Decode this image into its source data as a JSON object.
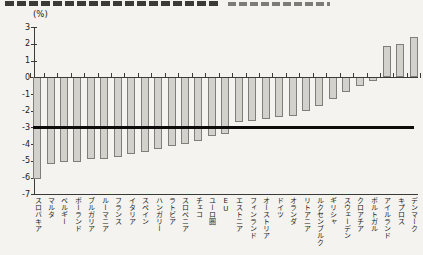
{
  "figure": {
    "cropped_title_visible": true,
    "unit_label": "(%)"
  },
  "chart_data": {
    "type": "bar",
    "title": "",
    "unit_label": "(%)",
    "categories": [
      "スロバキア",
      "マルタ",
      "ベルギー",
      "ポーランド",
      "ブルガリア",
      "ルーマニア",
      "フランス",
      "イタリア",
      "スペイン",
      "ハンガリー",
      "ラトビア",
      "スロベニア",
      "チェコ",
      "ユーロ圏",
      "EU",
      "エストニア",
      "フィンランド",
      "オーストリア",
      "ドイツ",
      "オランダ",
      "リトアニア",
      "ルクセンブルク",
      "ギリシャ",
      "スウェーデン",
      "クロアチア",
      "ポルトガル",
      "アイルランド",
      "キプロス",
      "デンマーク"
    ],
    "values": [
      -6.1,
      -5.2,
      -5.1,
      -5.1,
      -4.9,
      -4.9,
      -4.8,
      -4.6,
      -4.5,
      -4.3,
      -4.1,
      -4.0,
      -3.8,
      -3.5,
      -3.4,
      -2.7,
      -2.6,
      -2.5,
      -2.4,
      -2.3,
      -2.0,
      -1.7,
      -1.3,
      -0.9,
      -0.5,
      -0.2,
      1.9,
      2.0,
      2.4
    ],
    "y_ticks": [
      3,
      2,
      1,
      0,
      -1,
      -2,
      -3,
      -4,
      -5,
      -6,
      -7
    ],
    "ylim": [
      -7,
      3
    ],
    "reference_line_value": -3,
    "grid": false,
    "legend": false,
    "bar_color": "#d2d1cb",
    "bar_border_color": "#7f7e78",
    "reference_line_color": "#0c0c0a"
  }
}
